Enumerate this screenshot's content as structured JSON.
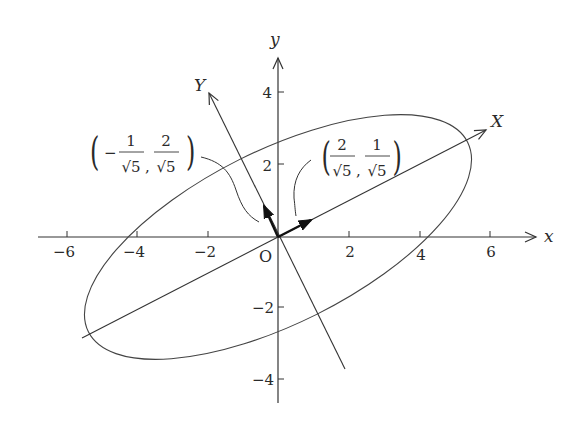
{
  "diagram": {
    "axes": {
      "x_label": "x",
      "y_label": "y",
      "origin_label": "O",
      "x_ticks": [
        "−6",
        "−4",
        "−2",
        "2",
        "4",
        "6"
      ],
      "y_ticks": [
        "4",
        "2",
        "−2",
        "−4"
      ]
    },
    "rotated_axes": {
      "X_label": "X",
      "Y_label": "Y"
    },
    "vectors": [
      {
        "name": "X-direction unit vector",
        "label": {
          "lparen": "(",
          "num1": "2",
          "den1": "√5",
          "sep": ",",
          "num2": "1",
          "den2": "√5",
          "rparen": ")"
        }
      },
      {
        "name": "Y-direction unit vector",
        "label": {
          "lparen": "(",
          "sign": "−",
          "num1": "1",
          "den1": "√5",
          "sep": ",",
          "num2": "2",
          "den2": "√5",
          "rparen": ")"
        }
      }
    ],
    "ellipse": {
      "semi_major": 6,
      "semi_minor": 2.45,
      "angle_deg": 26.57
    },
    "stroke_color": "#333333"
  }
}
